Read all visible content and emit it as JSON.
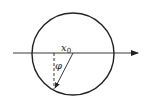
{
  "diagram": {
    "type": "geometry",
    "labels": {
      "point": "x",
      "point_subscript": "0",
      "angle": "φ"
    },
    "colors": {
      "stroke": "#222222",
      "background": "#ffffff"
    },
    "elements": [
      {
        "kind": "circle",
        "cx": 73,
        "cy": 54,
        "r": 41
      },
      {
        "kind": "axis-arrow",
        "x1": 13,
        "y1": 53,
        "x2": 138,
        "y2": 53
      },
      {
        "kind": "dashed-line",
        "x1": 54,
        "y1": 53,
        "x2": 54,
        "y2": 89
      },
      {
        "kind": "ray-arrow",
        "x1": 73,
        "y1": 53,
        "x2": 54,
        "y2": 89
      }
    ]
  }
}
